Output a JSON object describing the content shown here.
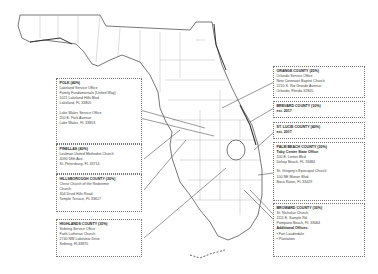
{
  "counties": {
    "polk": {
      "title": "POLK (40%)",
      "office1": [
        "Lakeland Service Office",
        "Family Fundamentals (United Way)",
        "1021 Lakeland Hills Blvd.",
        "Lakeland, FL 33805"
      ],
      "office2": [
        "Lake Wales Service Office",
        "250 E. Park Avenue",
        "Lake Wales, FL 33853"
      ]
    },
    "pinellas": {
      "title": "PINELLAS (40%)",
      "lines": [
        "Lealman United Methodist Church",
        "4090 58th Ave.",
        "St. Petersburg, FL 33714"
      ]
    },
    "hillsborough": {
      "title": "HILLSBOROUGH COUNTY (30%)",
      "lines": [
        "Christ Church of the Redeemer",
        "Church",
        "304 Druid Hills Road",
        "Temple Terrace, FL 33617"
      ]
    },
    "highlands": {
      "title": "HIGHLANDS COUNTY (30%)",
      "lines": [
        "Sebring Service Office",
        "Faith Lutheran Church",
        "2740 NW Lakeview Drive",
        "Sebring, FL33870"
      ]
    },
    "orange": {
      "title": "ORANGE COUNTY (25%)",
      "lines": [
        "Orlando Service Office",
        "New Covenant Baptist Church",
        "2210 S. Rio Grande Avenue",
        "Orlando, Florida 32805"
      ]
    },
    "brevard": {
      "title": "BREVARD COUNTY (10%)",
      "lines": [
        "est. 2017"
      ]
    },
    "st_lucie": {
      "title": "ST. LUCIE COUNTY (40%)",
      "lines": [
        "est. 2017"
      ]
    },
    "palm_beach": {
      "title": "PALM BEACH COUNTY (30%)",
      "subtitle": "Toby Center State Office",
      "office1": [
        "100 E. Linton Blvd",
        "Delray Beach, FL 33484"
      ],
      "office2": [
        "St. Gregory's Episcopal Church",
        "100 NE Mizner Blvd.",
        "Boca Raton, FL 33429"
      ]
    },
    "broward": {
      "title": "BROWARD COUNTY (30%)",
      "lines": [
        "St. Nicholas Church",
        "1111 E. Sample Rd.",
        "Pompano Beach, FL 33064"
      ],
      "additional_label": "Additional Offices:",
      "additional": [
        "• Fort Lauderdale",
        "• Plantation"
      ]
    }
  }
}
